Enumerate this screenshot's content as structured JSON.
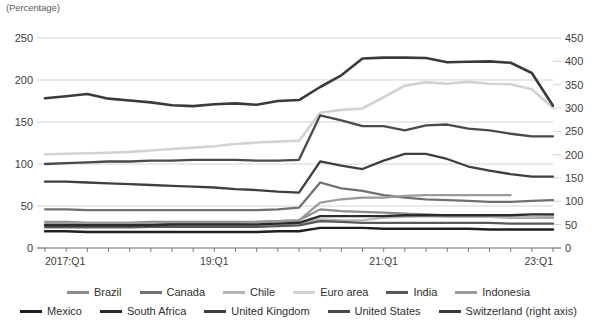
{
  "unit_label": "(Percentage)",
  "chart_data": {
    "type": "line",
    "title": "",
    "subtitle": "",
    "xlabel": "",
    "ylabel": "(Percentage)",
    "grid": true,
    "legend_position": "bottom",
    "x": [
      "2017:Q1",
      "2017:Q2",
      "2017:Q3",
      "2017:Q4",
      "2018:Q1",
      "2018:Q2",
      "2018:Q3",
      "2018:Q4",
      "2019:Q1",
      "2019:Q2",
      "2019:Q3",
      "2019:Q4",
      "2020:Q1",
      "2020:Q2",
      "2020:Q3",
      "2020:Q4",
      "2021:Q1",
      "2021:Q2",
      "2021:Q3",
      "2021:Q4",
      "2022:Q1",
      "2022:Q2",
      "2022:Q3",
      "2022:Q4",
      "2023:Q1"
    ],
    "xtick_labels": [
      "2017:Q1",
      "19:Q1",
      "21:Q1",
      "23:Q1"
    ],
    "xtick_indices": [
      0,
      8,
      16,
      24
    ],
    "left_axis": {
      "label": "(Percentage)",
      "ticks": [
        0,
        50,
        100,
        150,
        200,
        250
      ],
      "ylim": [
        0,
        250
      ]
    },
    "right_axis": {
      "label": "right axis",
      "ticks": [
        0,
        50,
        100,
        150,
        200,
        250,
        300,
        350,
        400,
        450
      ],
      "ylim": [
        0,
        450
      ]
    },
    "series": [
      {
        "name": "Brazil",
        "axis": "left",
        "color": "#8c8c8c",
        "width": 2.2,
        "values": [
          31,
          31,
          30,
          30,
          30,
          31,
          31,
          31,
          31,
          31,
          31,
          32,
          33,
          46,
          44,
          43,
          42,
          41,
          40,
          39,
          38,
          37,
          36,
          36,
          36
        ]
      },
      {
        "name": "Canada",
        "axis": "left",
        "color": "#707070",
        "width": 2.2,
        "values": [
          46,
          46,
          45,
          45,
          45,
          45,
          45,
          45,
          45,
          45,
          45,
          46,
          48,
          78,
          71,
          68,
          63,
          60,
          58,
          57,
          56,
          55,
          55,
          56,
          57
        ]
      },
      {
        "name": "Chile",
        "axis": "left",
        "color": "#b5b5b5",
        "width": 2.2,
        "values": [
          24,
          24,
          24,
          24,
          24,
          25,
          26,
          26,
          26,
          26,
          27,
          28,
          29,
          34,
          33,
          33,
          36,
          37,
          38,
          37,
          37,
          37,
          37,
          37,
          38
        ]
      },
      {
        "name": "Euro area",
        "axis": "right",
        "color": "#d2d2d2",
        "width": 2.6,
        "values": [
          201,
          202,
          203,
          204,
          206,
          209,
          212,
          215,
          218,
          223,
          226,
          228,
          230,
          290,
          296,
          299,
          323,
          348,
          355,
          352,
          356,
          352,
          351,
          340,
          300
        ]
      },
      {
        "name": "India",
        "axis": "left",
        "color": "#595959",
        "width": 2.2,
        "values": [
          25,
          25,
          25,
          25,
          25,
          25,
          25,
          25,
          25,
          25,
          25,
          26,
          27,
          32,
          31,
          30,
          30,
          30,
          30,
          30,
          30,
          30,
          29,
          29,
          29
        ]
      },
      {
        "name": "Indonesia",
        "axis": "left",
        "color": "#9a9a9a",
        "width": 2.2,
        "values": [
          30,
          30,
          30,
          30,
          30,
          30,
          30,
          30,
          30,
          30,
          31,
          32,
          33,
          54,
          58,
          60,
          60,
          62,
          63,
          63,
          63,
          63,
          63,
          null,
          null
        ]
      },
      {
        "name": "Mexico",
        "axis": "left",
        "color": "#1f1f1f",
        "width": 2.4,
        "values": [
          20,
          20,
          19,
          19,
          19,
          19,
          19,
          19,
          19,
          19,
          19,
          20,
          20,
          24,
          24,
          24,
          23,
          23,
          23,
          23,
          23,
          22,
          22,
          22,
          22
        ]
      },
      {
        "name": "South Africa",
        "axis": "left",
        "color": "#2b2b2b",
        "width": 2.4,
        "values": [
          27,
          27,
          27,
          27,
          27,
          27,
          28,
          28,
          28,
          28,
          28,
          29,
          30,
          38,
          38,
          38,
          38,
          39,
          39,
          39,
          39,
          39,
          39,
          40,
          40
        ]
      },
      {
        "name": "United Kingdom",
        "axis": "left",
        "color": "#3f3f3f",
        "width": 2.3,
        "values": [
          79,
          79,
          78,
          77,
          76,
          75,
          74,
          73,
          72,
          70,
          69,
          67,
          66,
          103,
          98,
          94,
          104,
          112,
          112,
          106,
          97,
          92,
          88,
          85,
          85
        ]
      },
      {
        "name": "United States",
        "axis": "left",
        "color": "#4a4a4a",
        "width": 2.3,
        "values": [
          100,
          101,
          102,
          103,
          103,
          104,
          104,
          105,
          105,
          105,
          104,
          104,
          105,
          158,
          152,
          145,
          145,
          140,
          146,
          147,
          142,
          140,
          136,
          133,
          133
        ]
      },
      {
        "name": "Switzerland (right axis)",
        "axis": "right",
        "color": "#3a3a3a",
        "width": 2.6,
        "values": [
          321,
          325,
          330,
          320,
          316,
          312,
          306,
          304,
          308,
          310,
          307,
          315,
          317,
          345,
          370,
          406,
          408,
          408,
          407,
          398,
          399,
          400,
          397,
          375,
          305
        ]
      }
    ]
  },
  "legend": {
    "row1": [
      {
        "label": "Brazil",
        "color": "#8c8c8c"
      },
      {
        "label": "Canada",
        "color": "#707070"
      },
      {
        "label": "Chile",
        "color": "#b5b5b5"
      },
      {
        "label": "Euro area",
        "color": "#d2d2d2"
      },
      {
        "label": "India",
        "color": "#595959"
      },
      {
        "label": "Indonesia",
        "color": "#9a9a9a"
      }
    ],
    "row2": [
      {
        "label": "Mexico",
        "color": "#1f1f1f"
      },
      {
        "label": "South Africa",
        "color": "#2b2b2b"
      },
      {
        "label": "United Kingdom",
        "color": "#3f3f3f"
      },
      {
        "label": "United States",
        "color": "#4a4a4a"
      },
      {
        "label": "Switzerland (right axis)",
        "color": "#3a3a3a"
      }
    ]
  }
}
